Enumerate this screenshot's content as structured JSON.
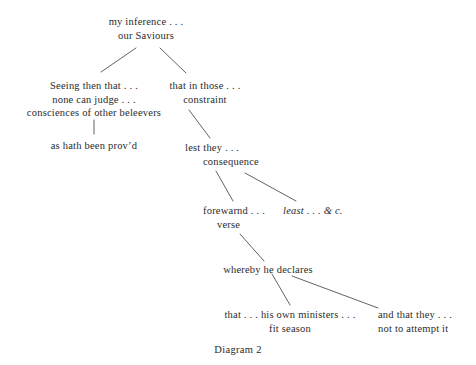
{
  "diagram": {
    "caption": "Diagram 2",
    "ink_color": "#2b2b2b",
    "line_color": "#3a3a3a",
    "background_color": "#ffffff",
    "nodes": {
      "root": {
        "line1": "my inference . . .",
        "line2": "our Saviours"
      },
      "left_branch": {
        "line1": "Seeing then that . . .",
        "line2": "none can judge . . .",
        "line3": "consciences of other beleevers"
      },
      "left_leaf": {
        "line1": "as hath been prov’d"
      },
      "right_branch": {
        "line1": "that in those . . .",
        "line2": "constraint"
      },
      "lest_they": {
        "line1": "lest they . . .",
        "line2": "consequence"
      },
      "forewarnd": {
        "line1": "forewarnd . . .",
        "line2": "verse"
      },
      "least": {
        "line1": "least . . . & c."
      },
      "whereby": {
        "line1": "whereby he declares"
      },
      "ministers": {
        "line1": "that . . . his own ministers . . .",
        "line2": "fit season"
      },
      "attempt": {
        "line1": "and that they . . .",
        "line2": "not to attempt it"
      }
    }
  }
}
